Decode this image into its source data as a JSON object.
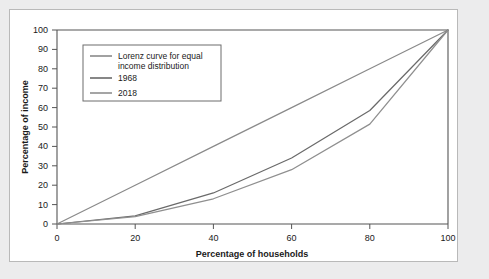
{
  "figure": {
    "background_color": "#ececed",
    "panel_color": "#ffffff",
    "border_color": "#b9b9b9"
  },
  "chart_data": {
    "type": "line",
    "title": "",
    "xlabel": "Percentage of households",
    "ylabel": "Percentage of income",
    "xlim": [
      0,
      100
    ],
    "ylim": [
      0,
      100
    ],
    "xticks": [
      "0",
      "20",
      "40",
      "60",
      "80",
      "100"
    ],
    "yticks": [
      "0",
      "10",
      "20",
      "30",
      "40",
      "50",
      "60",
      "70",
      "80",
      "90",
      "100"
    ],
    "grid": false,
    "legend_position": "upper left",
    "x": [
      0,
      20,
      40,
      60,
      80,
      100
    ],
    "series": [
      {
        "name": "Lorenz curve for equal income distribution",
        "color": "#8a8a8a",
        "values": [
          0,
          20,
          40,
          60,
          80,
          100
        ]
      },
      {
        "name": "1968",
        "color": "#6a6a6a",
        "values": [
          0,
          4.2,
          16.0,
          34.0,
          58.5,
          100
        ]
      },
      {
        "name": "2018",
        "color": "#8f8f8f",
        "values": [
          0,
          3.8,
          13.0,
          28.0,
          51.5,
          100
        ]
      }
    ]
  },
  "legend": {
    "entries": [
      {
        "label_line1": "Lorenz curve for equal",
        "label_line2": "income distribution"
      },
      {
        "label_line1": "1968",
        "label_line2": ""
      },
      {
        "label_line1": "2018",
        "label_line2": ""
      }
    ]
  }
}
